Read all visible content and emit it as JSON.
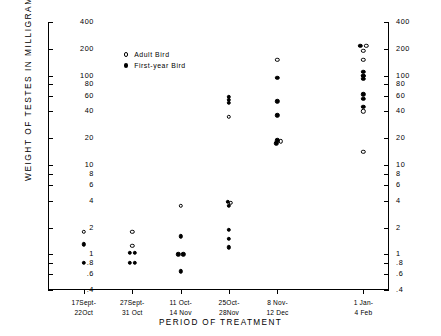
{
  "chart_data": {
    "type": "scatter",
    "title": "",
    "xlabel": "PERIOD OF TREATMENT",
    "ylabel": "WEIGHT OF TESTES IN MILLIGRAMS",
    "yscale": "log",
    "ylim": [
      0.4,
      400
    ],
    "grid": false,
    "legend_position": "top-left",
    "y_ticks": [
      {
        "value": 400,
        "label": "400"
      },
      {
        "value": 200,
        "label": "200"
      },
      {
        "value": 100,
        "label": "100"
      },
      {
        "value": 80,
        "label": "80"
      },
      {
        "value": 60,
        "label": "60"
      },
      {
        "value": 40,
        "label": "40"
      },
      {
        "value": 20,
        "label": "20"
      },
      {
        "value": 10,
        "label": "10"
      },
      {
        "value": 8,
        "label": "8"
      },
      {
        "value": 6,
        "label": "6"
      },
      {
        "value": 4,
        "label": "4"
      },
      {
        "value": 2,
        "label": "2"
      },
      {
        "value": 1,
        "label": "1"
      },
      {
        "value": 0.8,
        "label": ".8"
      },
      {
        "value": 0.6,
        "label": ".6"
      },
      {
        "value": 0.4,
        "label": ".4"
      }
    ],
    "categories": [
      {
        "line1": "17Sept-",
        "line2": "22Oct"
      },
      {
        "line1": "27Sept-",
        "line2": "31 Oct"
      },
      {
        "line1": "11 Oct-",
        "line2": "14 Nov"
      },
      {
        "line1": "25Oct-",
        "line2": "28Nov"
      },
      {
        "line1": "8 Nov-",
        "line2": "12 Dec"
      },
      {
        "line1": "1 Jan-",
        "line2": "4 Feb"
      }
    ],
    "series": [
      {
        "name": "Adult Bird",
        "marker": "open",
        "points": [
          {
            "cat": 0,
            "y": 1.8,
            "dx": 0
          },
          {
            "cat": 1,
            "y": 1.8,
            "dx": 0
          },
          {
            "cat": 1,
            "y": 1.25,
            "dx": 0
          },
          {
            "cat": 2,
            "y": 3.5,
            "dx": 0
          },
          {
            "cat": 3,
            "y": 35,
            "dx": 0
          },
          {
            "cat": 3,
            "y": 3.8,
            "dx": 1.5
          },
          {
            "cat": 4,
            "y": 150,
            "dx": 0
          },
          {
            "cat": 4,
            "y": 18.5,
            "dx": 3.5
          },
          {
            "cat": 5,
            "y": 215,
            "dx": 3
          },
          {
            "cat": 5,
            "y": 190,
            "dx": 0
          },
          {
            "cat": 5,
            "y": 150,
            "dx": 0
          },
          {
            "cat": 5,
            "y": 100,
            "dx": 0
          },
          {
            "cat": 5,
            "y": 40,
            "dx": 0
          },
          {
            "cat": 5,
            "y": 14,
            "dx": 0
          }
        ]
      },
      {
        "name": "First-year Bird",
        "marker": "filled",
        "points": [
          {
            "cat": 0,
            "y": 1.3,
            "dx": 0
          },
          {
            "cat": 0,
            "y": 0.8,
            "dx": 0
          },
          {
            "cat": 1,
            "y": 1.05,
            "dx": -2.5
          },
          {
            "cat": 1,
            "y": 1.05,
            "dx": 2.5
          },
          {
            "cat": 1,
            "y": 0.8,
            "dx": -2.5
          },
          {
            "cat": 1,
            "y": 0.8,
            "dx": 2.5
          },
          {
            "cat": 2,
            "y": 1.6,
            "dx": 0
          },
          {
            "cat": 2,
            "y": 1.0,
            "dx": -2.5
          },
          {
            "cat": 2,
            "y": 1.0,
            "dx": 2.5
          },
          {
            "cat": 2,
            "y": 0.65,
            "dx": 0
          },
          {
            "cat": 3,
            "y": 58,
            "dx": 0
          },
          {
            "cat": 3,
            "y": 54,
            "dx": 0
          },
          {
            "cat": 3,
            "y": 50,
            "dx": 0
          },
          {
            "cat": 3,
            "y": 3.9,
            "dx": -1.5
          },
          {
            "cat": 3,
            "y": 3.5,
            "dx": 0
          },
          {
            "cat": 3,
            "y": 1.9,
            "dx": 0
          },
          {
            "cat": 3,
            "y": 1.5,
            "dx": 0
          },
          {
            "cat": 3,
            "y": 1.2,
            "dx": 0
          },
          {
            "cat": 4,
            "y": 95,
            "dx": 0
          },
          {
            "cat": 4,
            "y": 52,
            "dx": 0
          },
          {
            "cat": 4,
            "y": 36,
            "dx": 0
          },
          {
            "cat": 4,
            "y": 19,
            "dx": 0
          },
          {
            "cat": 4,
            "y": 17.5,
            "dx": -1
          },
          {
            "cat": 5,
            "y": 215,
            "dx": -3
          },
          {
            "cat": 5,
            "y": 110,
            "dx": 0
          },
          {
            "cat": 5,
            "y": 100,
            "dx": 0
          },
          {
            "cat": 5,
            "y": 92,
            "dx": 0
          },
          {
            "cat": 5,
            "y": 62,
            "dx": 0
          },
          {
            "cat": 5,
            "y": 55,
            "dx": 0
          },
          {
            "cat": 5,
            "y": 45,
            "dx": 0
          }
        ]
      }
    ]
  }
}
